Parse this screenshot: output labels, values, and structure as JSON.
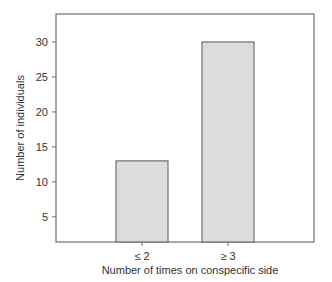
{
  "chart_data": {
    "type": "bar",
    "title": "",
    "xlabel": "Number of times on conspecific side",
    "ylabel": "Number of individuals",
    "categories": [
      "≤ 2",
      "≥ 3"
    ],
    "values": [
      13,
      30
    ],
    "ylim": [
      1.4,
      34
    ],
    "yticks": [
      5,
      10,
      15,
      20,
      25,
      30
    ],
    "grid": false,
    "legend": "none",
    "colors": {
      "bar_fill": "#dcdcdc",
      "bar_stroke": "#707070",
      "axis": "#707070",
      "text": "#333333"
    }
  }
}
